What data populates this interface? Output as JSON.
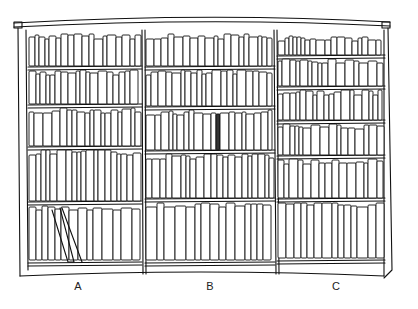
{
  "image": {
    "subject": "Hand-drawn line sketch of a three-section bookcase",
    "background": "#ffffff",
    "ink_color": "#111111",
    "highlight_color": "#333333"
  },
  "bookcase": {
    "cornice": {
      "left": 14,
      "right": 390,
      "top": 24
    },
    "sections": [
      {
        "label": "A",
        "x0": 28,
        "x1": 142,
        "shelf_count": 5,
        "shelves_y": [
          32,
          68,
          106,
          148,
          203,
          264
        ],
        "label_x": 78,
        "label_y": 280
      },
      {
        "label": "B",
        "x0": 145,
        "x1": 275,
        "shelf_count": 5,
        "shelves_y": [
          32,
          68,
          108,
          152,
          200,
          264
        ],
        "label_x": 210,
        "label_y": 280
      },
      {
        "label": "C",
        "x0": 277,
        "x1": 385,
        "shelf_count": 6,
        "shelves_y": [
          34,
          57,
          88,
          122,
          157,
          200,
          262
        ],
        "label_x": 336,
        "label_y": 280
      }
    ],
    "highlighted_book": {
      "section": "B",
      "shelf": 3,
      "x": 218,
      "width": 7
    }
  }
}
